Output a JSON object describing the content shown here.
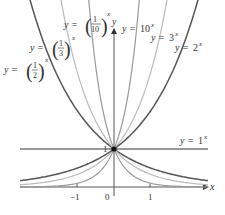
{
  "chart_data": {
    "type": "line",
    "title": "",
    "xlabel": "x",
    "ylabel": "y",
    "xlim": [
      -2.6,
      2.6
    ],
    "ylim": [
      -0.3,
      4.2
    ],
    "grid": false,
    "x_ticks": [
      "-1",
      "0",
      "1"
    ],
    "y_ticks": [
      "1"
    ],
    "annotations": [
      "common point (0, 1)"
    ],
    "series": [
      {
        "name": "y = (1/2)^x",
        "base": 0.5,
        "color": "#555555",
        "label_base_num": "1",
        "label_base_den": "2"
      },
      {
        "name": "y = (1/3)^x",
        "base": 0.3333,
        "color": "#bbbbbb",
        "label_base_num": "1",
        "label_base_den": "3"
      },
      {
        "name": "y = (1/10)^x",
        "base": 0.1,
        "color": "#999999",
        "label_base_num": "1",
        "label_base_den": "10"
      },
      {
        "name": "y = 10^x",
        "base": 10,
        "color": "#999999",
        "label_base": "10"
      },
      {
        "name": "y = 3^x",
        "base": 3,
        "color": "#bbbbbb",
        "label_base": "3"
      },
      {
        "name": "y = 2^x",
        "base": 2,
        "color": "#555555",
        "label_base": "2"
      },
      {
        "name": "y = 1^x",
        "base": 1,
        "color": "#777777",
        "label_base": "1"
      }
    ]
  },
  "labels": {
    "y_eq": "y =",
    "x_sup": "x",
    "x_axis": "x",
    "y_axis": "y",
    "tick_neg1": "−1",
    "tick_0": "0",
    "tick_1": "1",
    "y_tick_1": "1",
    "half_num": "1",
    "half_den": "2",
    "third_num": "1",
    "third_den": "3",
    "tenth_num": "1",
    "tenth_den": "10",
    "ten": "10",
    "three": "3",
    "two": "2",
    "one": "1"
  }
}
